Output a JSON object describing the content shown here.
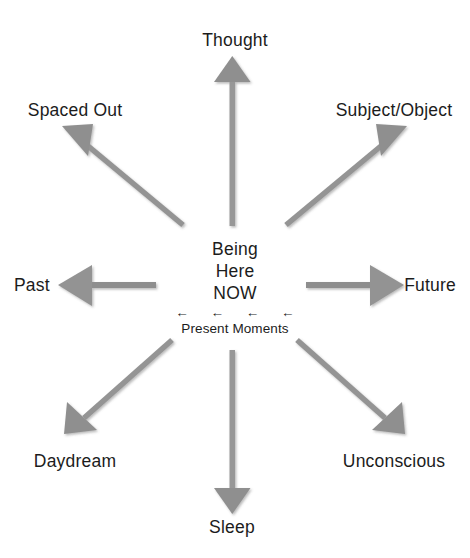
{
  "diagram": {
    "title": "Being Here NOW",
    "background_color": "#ffffff",
    "arrow_color": "#909090",
    "text_color": "#1c1c1c",
    "center": {
      "line1": "Being",
      "line2": "Here",
      "line3": "NOW",
      "present_arrows": "← ← ← ←",
      "present_label": "Present Moments"
    },
    "nodes": [
      {
        "id": "thought",
        "label": "Thought",
        "direction": "up",
        "label_x": 235,
        "label_y": 40,
        "anchor": "center"
      },
      {
        "id": "spaced-out",
        "label": "Spaced Out",
        "direction": "up-left",
        "label_x": 75,
        "label_y": 110,
        "anchor": "center"
      },
      {
        "id": "subject-object",
        "label": "Subject/Object",
        "direction": "up-right",
        "label_x": 394,
        "label_y": 110,
        "anchor": "center"
      },
      {
        "id": "past",
        "label": "Past",
        "direction": "left",
        "label_x": 14,
        "label_y": 285,
        "anchor": "left"
      },
      {
        "id": "future",
        "label": "Future",
        "direction": "right",
        "label_x": 456,
        "label_y": 285,
        "anchor": "right"
      },
      {
        "id": "daydream",
        "label": "Daydream",
        "direction": "down-left",
        "label_x": 75,
        "label_y": 461,
        "anchor": "center"
      },
      {
        "id": "unconscious",
        "label": "Unconscious",
        "direction": "down-right",
        "label_x": 394,
        "label_y": 461,
        "anchor": "center"
      },
      {
        "id": "sleep",
        "label": "Sleep",
        "direction": "down",
        "label_x": 232,
        "label_y": 527,
        "anchor": "center"
      }
    ]
  }
}
